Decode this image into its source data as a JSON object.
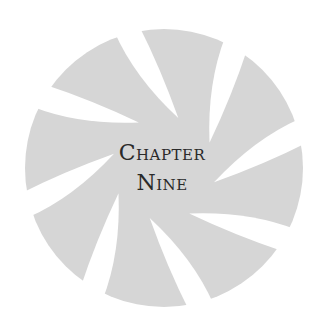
{
  "heading": {
    "line1": "Chapter",
    "line2": "Nine"
  },
  "emblem": {
    "fill_color": "#d6d6d6",
    "gap_color": "#ffffff",
    "blade_count": 8,
    "swirl_direction": "clockwise"
  }
}
